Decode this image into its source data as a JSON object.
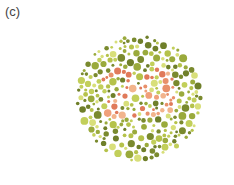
{
  "figure": {
    "label": "(c)",
    "plate": {
      "type": "ishihara-color-plate",
      "hidden_number": "29",
      "center": [
        139,
        98
      ],
      "radius": 64,
      "colors": {
        "background_dots": [
          "#7a8a2e",
          "#9aaa3c",
          "#c2cf5a",
          "#d8df7a",
          "#b5c24a",
          "#6f7f2a"
        ],
        "figure_dots": [
          "#e8906a",
          "#f0a07a",
          "#e07a5a",
          "#f2b48c"
        ]
      }
    }
  }
}
